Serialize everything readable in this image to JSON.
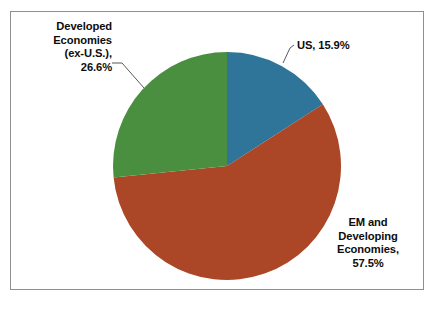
{
  "figure": {
    "background_color": "#ffffff",
    "frame_color": "#8f8f8f"
  },
  "chart_data": {
    "type": "pie",
    "title": "",
    "subtitle": "",
    "xlabel": "",
    "ylabel": "",
    "legend_position": "none",
    "grid": false,
    "labels_as_callouts": true,
    "start_angle_deg": 0,
    "direction": "clockwise",
    "categories": [
      "US",
      "EM and Developing Economies",
      "Developed Economies (ex-U.S.)"
    ],
    "values": [
      15.9,
      57.5,
      26.6
    ],
    "units": "percent",
    "total": 100.0,
    "colors": [
      "#2f7599",
      "#ab4626",
      "#4a8f40"
    ],
    "slices": [
      {
        "name": "US",
        "value": 15.9,
        "color": "#2f7599",
        "start_angle_deg": 0.0,
        "end_angle_deg": 57.2,
        "label_text": "US, 15.9%",
        "label_lines": [
          "US, 15.9%"
        ]
      },
      {
        "name": "EM and Developing Economies",
        "value": 57.5,
        "color": "#ab4626",
        "start_angle_deg": 57.2,
        "end_angle_deg": 264.2,
        "label_text": "EM and Developing Economies, 57.5%",
        "label_lines": [
          "EM and",
          "Developing",
          "Economies,",
          "57.5%"
        ]
      },
      {
        "name": "Developed Economies (ex-U.S.)",
        "value": 26.6,
        "color": "#4a8f40",
        "start_angle_deg": 264.2,
        "end_angle_deg": 360.0,
        "label_text": "Developed Economies (ex-U.S.), 26.6%",
        "label_lines": [
          "Developed",
          "Economies",
          "(ex-U.S.),",
          "26.6%"
        ]
      }
    ]
  },
  "labels": {
    "developed": "Developed\nEconomies\n(ex-U.S.),\n26.6%",
    "us": "US, 15.9%",
    "em": "EM and\nDeveloping\nEconomies,\n57.5%"
  }
}
